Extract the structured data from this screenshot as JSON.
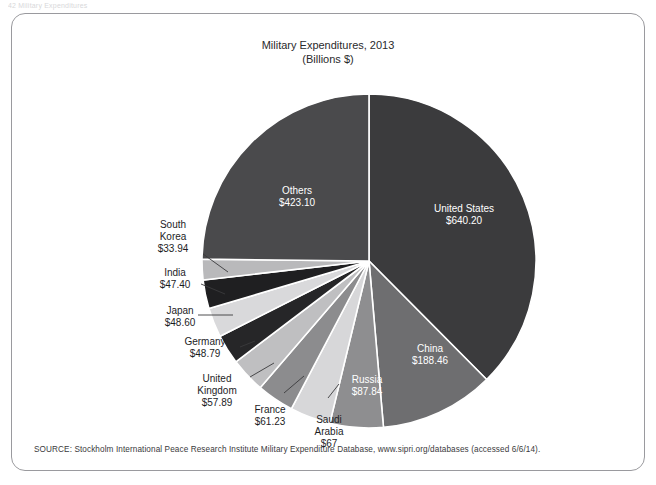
{
  "page_header": "42  Military Expenditures",
  "figure": {
    "title_line1": "Military Expenditures, 2013",
    "title_line2": "(Billions $)",
    "source": "SOURCE: Stockholm International Peace Research Institute Military Expenditure Database, www.sipri.org/databases (accessed 6/6/14)."
  },
  "chart_data": {
    "type": "pie",
    "title": "Military Expenditures, 2013",
    "subtitle": "(Billions $)",
    "unit": "Billions of US dollars",
    "start_angle_deg": 0,
    "direction": "clockwise",
    "total": 1744.55,
    "legend": "none (direct labels)",
    "categories": [
      "United States",
      "China",
      "Russia",
      "Saudi Arabia",
      "France",
      "United Kingdom",
      "Germany",
      "Japan",
      "India",
      "South Korea",
      "Others"
    ],
    "values": [
      640.2,
      188.46,
      87.84,
      67,
      61.23,
      57.89,
      48.79,
      48.6,
      47.4,
      33.94,
      423.1
    ],
    "slices": [
      {
        "label": "United States",
        "value_label": "$640.20",
        "value": 640.2,
        "color": "#3b3b3d",
        "label_fill": "inside",
        "lx": 452,
        "ly": 198,
        "leader": null
      },
      {
        "label": "China",
        "value_label": "$188.46",
        "value": 188.46,
        "color": "#6e6e70",
        "label_fill": "inside",
        "lx": 418,
        "ly": 338,
        "leader": null
      },
      {
        "label": "Russia",
        "value_label": "$87.84",
        "value": 87.84,
        "color": "#8e8e90",
        "label_fill": "inside",
        "lx": 355,
        "ly": 369,
        "leader": null
      },
      {
        "label": "Saudi Arabia",
        "value_label": "$67",
        "value": 67,
        "color": "#d7d7d9",
        "label_fill": "outside",
        "lx": 317,
        "ly": 409,
        "leader": [
          316,
          384,
          327,
          370
        ]
      },
      {
        "label": "France",
        "value_label": "$61.23",
        "value": 61.23,
        "color": "#8c8c8e",
        "label_fill": "outside",
        "lx": 258,
        "ly": 399,
        "leader": [
          272,
          379,
          292,
          362
        ]
      },
      {
        "label": "United Kingdom",
        "value_label": "$57.89",
        "value": 57.89,
        "color": "#bfbfc1",
        "label_fill": "outside",
        "lx": 205,
        "ly": 368,
        "leader": [
          238,
          363,
          262,
          349
        ]
      },
      {
        "label": "Germany",
        "value_label": "$48.79",
        "value": 48.79,
        "color": "#262628",
        "label_fill": "outside",
        "lx": 193,
        "ly": 331,
        "leader": [
          228,
          333,
          243,
          327
        ]
      },
      {
        "label": "Japan",
        "value_label": "$48.60",
        "value": 48.6,
        "color": "#d9d9db",
        "label_fill": "outside",
        "lx": 168,
        "ly": 300,
        "leader": [
          186,
          301,
          221,
          301
        ]
      },
      {
        "label": "India",
        "value_label": "$47.40",
        "value": 47.4,
        "color": "#1f1f21",
        "label_fill": "outside",
        "lx": 163,
        "ly": 262,
        "leader": [
          189,
          270,
          213,
          280
        ]
      },
      {
        "label": "South Korea",
        "value_label": "$33.94",
        "value": 33.94,
        "color": "#b9b9bb",
        "label_fill": "outside",
        "lx": 161,
        "ly": 214,
        "leader": [
          191,
          240,
          216,
          258
        ]
      },
      {
        "label": "Others",
        "value_label": "$423.10",
        "value": 423.1,
        "color": "#4a4a4c",
        "label_fill": "inside",
        "lx": 285,
        "ly": 180,
        "leader": null
      }
    ],
    "geometry": {
      "cx": 357,
      "cy": 247,
      "r": 167
    }
  }
}
